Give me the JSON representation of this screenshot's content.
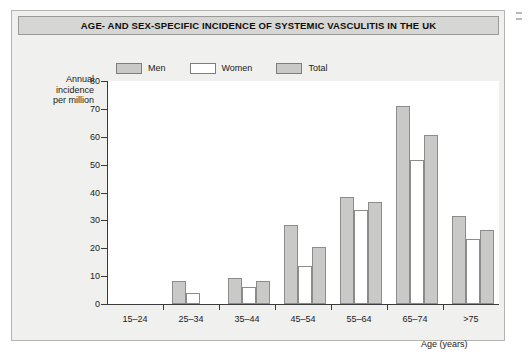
{
  "title": "AGE- AND SEX-SPECIFIC INCIDENCE OF SYSTEMIC VASCULITIS IN THE UK",
  "legend": [
    {
      "label": "Men",
      "color": "#c9c9c7"
    },
    {
      "label": "Women",
      "color": "#ffffff"
    },
    {
      "label": "Total",
      "color": "#c9c9c7"
    }
  ],
  "axes": {
    "y_title_line1": "Annual",
    "y_title_line2": "incidence",
    "y_title_line3": "per million",
    "x_title": "Age (years)"
  },
  "colors": {
    "bar_men": "#c9c9c7",
    "bar_women": "#ffffff",
    "bar_total": "#c9c9c7",
    "bar_border": "#8c8c8a",
    "axis": "#3a3a3a",
    "title_bar_bg": "#d6d6d4",
    "figure_bg": "#f0f0ee",
    "plot_bg": "#ffffff"
  },
  "chart_data": {
    "type": "bar",
    "title": "AGE- AND SEX-SPECIFIC INCIDENCE OF SYSTEMIC VASCULITIS IN THE UK",
    "xlabel": "Age (years)",
    "ylabel": "Annual incidence per million",
    "categories": [
      "15–24",
      "25–34",
      "35–44",
      "45–54",
      "55–64",
      "65–74",
      ">75"
    ],
    "series": [
      {
        "name": "Men",
        "values": [
          0,
          8.2,
          9.3,
          28.5,
          38.5,
          71.0,
          31.5
        ]
      },
      {
        "name": "Women",
        "values": [
          0,
          4.0,
          6.0,
          13.5,
          33.8,
          51.8,
          23.5
        ]
      },
      {
        "name": "Total",
        "values": [
          0,
          0,
          8.2,
          20.5,
          36.5,
          60.5,
          26.5
        ]
      }
    ],
    "ylim": [
      0,
      80
    ],
    "yticks": [
      0,
      10,
      20,
      30,
      40,
      50,
      60,
      70,
      80
    ],
    "ytick_labels": [
      "0",
      "10",
      "20",
      "30",
      "40",
      "50",
      "60",
      "70",
      "80"
    ],
    "grid": false,
    "legend_position": "top"
  }
}
